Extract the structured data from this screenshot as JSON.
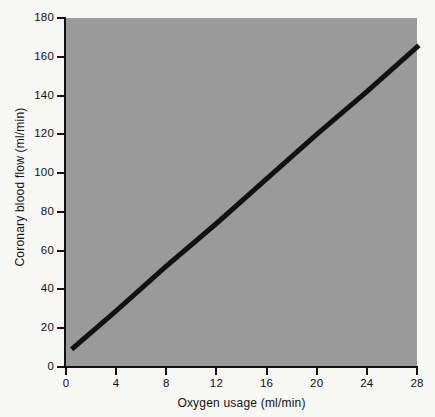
{
  "chart_data": {
    "type": "line",
    "title": "",
    "subtitle": "",
    "xlabel": "Oxygen usage (ml/min)",
    "ylabel": "Coronary blood flow (ml/min)",
    "xlim": [
      0,
      28
    ],
    "ylim": [
      0,
      180
    ],
    "xticks": [
      0,
      4,
      8,
      12,
      16,
      20,
      24,
      28
    ],
    "yticks": [
      0,
      20,
      40,
      60,
      80,
      100,
      120,
      140,
      160,
      180
    ],
    "xticklabels": [
      "0",
      "4",
      "8",
      "12",
      "16",
      "20",
      "24",
      "28"
    ],
    "yticklabels": [
      "0",
      "20",
      "40",
      "60",
      "80",
      "100",
      "120",
      "140",
      "160",
      "180"
    ],
    "grid": false,
    "legend": null,
    "plot_background_color": "#9a9a9a",
    "figure_background_color": "#f7f7f5",
    "series": [
      {
        "name": "Coronary blood flow vs oxygen usage",
        "color": "#111111",
        "line_width_px": 5,
        "x": [
          0.6,
          4,
          8,
          12,
          16,
          20,
          24,
          28
        ],
        "values": [
          10,
          29,
          52,
          74,
          97,
          120,
          142,
          165
        ]
      }
    ],
    "annotations": []
  },
  "figure": {
    "axis_color": "#111111",
    "tick_color": "#111111",
    "text_color": "#111111"
  }
}
